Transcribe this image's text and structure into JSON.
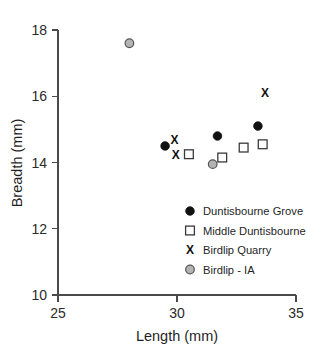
{
  "chart_data": {
    "type": "scatter",
    "title": "",
    "xlabel": "Length (mm)",
    "ylabel": "Breadth (mm)",
    "xlim": [
      25,
      35
    ],
    "ylim": [
      10,
      18
    ],
    "xticks": [
      25,
      30,
      35
    ],
    "yticks": [
      10,
      12,
      14,
      16,
      18
    ],
    "xtick_labels": [
      "25",
      "30",
      "35"
    ],
    "ytick_labels": [
      "10",
      "12",
      "14",
      "16",
      "18"
    ],
    "grid": false,
    "legend_position": "lower-right",
    "series": [
      {
        "name": "Duntisbourne Grove",
        "marker": "filled-circle",
        "color": "#111111",
        "points": [
          {
            "x": 29.5,
            "y": 14.5
          },
          {
            "x": 31.7,
            "y": 14.8
          },
          {
            "x": 33.4,
            "y": 15.1
          }
        ]
      },
      {
        "name": "Middle Duntisbourne",
        "marker": "open-square",
        "color": "#3a3a3a",
        "points": [
          {
            "x": 30.5,
            "y": 14.25
          },
          {
            "x": 31.9,
            "y": 14.15
          },
          {
            "x": 32.8,
            "y": 14.45
          },
          {
            "x": 33.6,
            "y": 14.55
          }
        ]
      },
      {
        "name": "Birdlip Quarry",
        "marker": "x",
        "color": "#111111",
        "points": [
          {
            "x": 29.9,
            "y": 14.7
          },
          {
            "x": 29.95,
            "y": 14.25
          },
          {
            "x": 33.7,
            "y": 16.1
          }
        ]
      },
      {
        "name": "Birdlip - IA",
        "marker": "grey-circle",
        "color": "#b4b4b4",
        "points": [
          {
            "x": 28.0,
            "y": 17.6
          },
          {
            "x": 31.5,
            "y": 13.95
          }
        ]
      }
    ],
    "legend_entries": [
      {
        "label": "Duntisbourne Grove",
        "marker": "filled-circle"
      },
      {
        "label": "Middle Duntisbourne",
        "marker": "open-square"
      },
      {
        "label": "Birdlip Quarry",
        "marker": "x"
      },
      {
        "label": "Birdlip - IA",
        "marker": "grey-circle"
      }
    ]
  }
}
